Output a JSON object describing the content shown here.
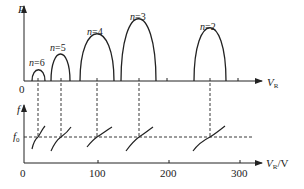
{
  "top_plot": {
    "y_axis_label": "P",
    "x_axis_label": "V",
    "x_axis_subscript": "R",
    "origin_label": "0",
    "modes": [
      {
        "label": "n=6",
        "n": "6",
        "x_start": 32,
        "x_end": 45,
        "peak_y": 70
      },
      {
        "label": "n=5",
        "n": "5",
        "x_start": 51,
        "x_end": 70,
        "peak_y": 55
      },
      {
        "label": "n=4",
        "n": "4",
        "x_start": 80,
        "x_end": 114,
        "peak_y": 38
      },
      {
        "label": "n=3",
        "n": "3",
        "x_start": 121,
        "x_end": 156,
        "peak_y": 24
      },
      {
        "label": "n=2",
        "n": "2",
        "x_start": 194,
        "x_end": 226,
        "peak_y": 33
      }
    ]
  },
  "bottom_plot": {
    "y_axis_label": "f",
    "reference_label": "f",
    "reference_subscript": "0",
    "x_axis_label": "V",
    "x_axis_subscript": "R",
    "x_axis_unit": "/V",
    "tick_labels": [
      "0",
      "100",
      "200",
      "300"
    ]
  },
  "colors": {
    "line": "#222222",
    "background": "#ffffff"
  }
}
